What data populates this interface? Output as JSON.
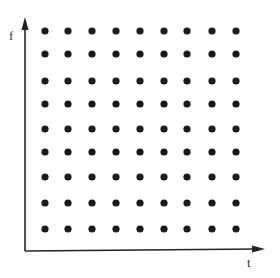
{
  "diagram": {
    "title": "",
    "axes": {
      "y_label": "f",
      "x_label": "t",
      "color": "#222222"
    },
    "grid": {
      "rows": 9,
      "columns": 9,
      "dot_color": "#1a1a1a",
      "x_positions": [
        45,
        68,
        92,
        116,
        140,
        164,
        187,
        212,
        236
      ],
      "y_positions": [
        31,
        54,
        81,
        104,
        129,
        152,
        177,
        203,
        229
      ]
    }
  }
}
